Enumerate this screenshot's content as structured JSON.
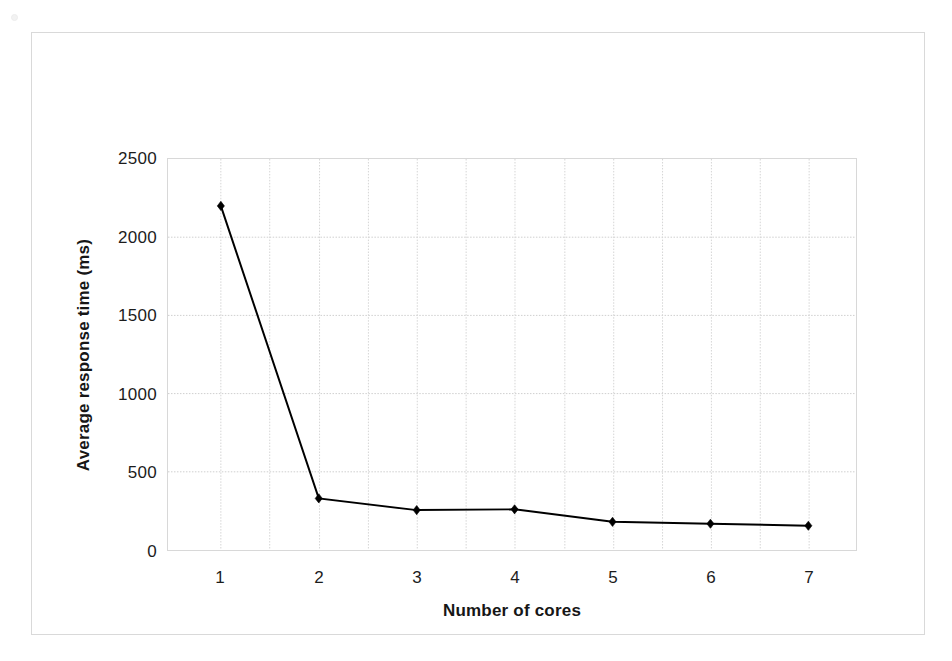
{
  "chart_data": {
    "type": "line",
    "title": "",
    "subtitle": "",
    "xlabel": "Number of cores",
    "ylabel": "Average response time (ms)",
    "categories": [
      "1",
      "2",
      "3",
      "4",
      "5",
      "6",
      "7"
    ],
    "x": [
      1,
      2,
      3,
      4,
      5,
      6,
      7
    ],
    "values": [
      2200,
      330,
      255,
      260,
      180,
      168,
      155
    ],
    "series": [
      {
        "name": "Average response time",
        "values": [
          2200,
          330,
          255,
          260,
          180,
          168,
          155
        ],
        "color": "#000000",
        "marker": "diamond",
        "line_width": 2
      }
    ],
    "ylim": [
      0,
      2500
    ],
    "yticks": [
      0,
      500,
      1000,
      1500,
      2000,
      2500
    ],
    "ytick_labels": [
      "0",
      "500",
      "1000",
      "1500",
      "2000",
      "2500"
    ],
    "xtick_labels": [
      "1",
      "2",
      "3",
      "4",
      "5",
      "6",
      "7"
    ],
    "grid": {
      "horizontal": true,
      "vertical": true,
      "style": "dotted",
      "color": "#d0d0d0",
      "minor_vertical": true
    },
    "legend": {
      "visible": false,
      "position": "none",
      "entries": []
    },
    "annotations": [],
    "plot_background": "#ffffff",
    "border_color": "#d9d9d9"
  },
  "axes": {
    "y_title": "Average response time (ms)",
    "x_title": "Number of cores"
  }
}
